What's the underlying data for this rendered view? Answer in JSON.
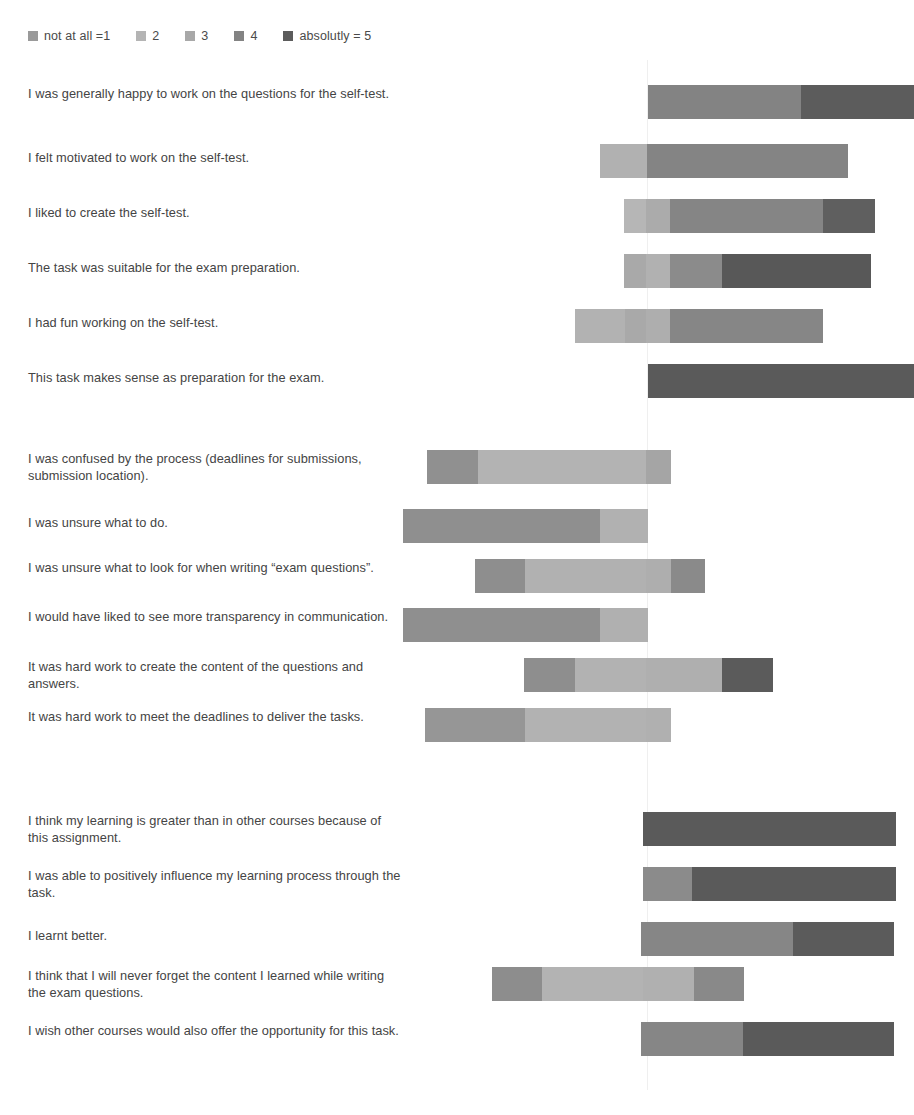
{
  "legend": {
    "title": "",
    "items": [
      {
        "label": "not at all =1",
        "value": 1,
        "color": "#9a9a9a"
      },
      {
        "label": "2",
        "value": 2,
        "color": "#b4b4b4"
      },
      {
        "label": "3",
        "value": 3,
        "color": "#a8a8a8"
      },
      {
        "label": "4",
        "value": 4,
        "color": "#838383"
      },
      {
        "label": "absolutly = 5",
        "value": 5,
        "color": "#5c5c5c"
      }
    ]
  },
  "chart_data": {
    "type": "bar",
    "subtype": "diverging-stacked-likert",
    "title": "",
    "xlabel": "",
    "ylabel": "",
    "scale": {
      "points": 5,
      "min_label": "not at all =1",
      "max_label": "absolutly = 5",
      "colors": [
        "#9a9a9a",
        "#b4b4b4",
        "#a8a8a8",
        "#838383",
        "#5c5c5c"
      ]
    },
    "axis": {
      "grid": false,
      "neutral_center_px": 647,
      "plot_left_px": 403,
      "plot_right_px": 914,
      "units": "percent of respondents"
    },
    "groups": [
      {
        "name": "group-1",
        "categories": [
          "I was generally happy to work on the questions for the self-test.",
          "I felt motivated to work on the self-test.",
          "I liked to create the self-test.",
          "The task was suitable for the exam preparation.",
          "I had fun working on the self-test.",
          "This task makes sense as preparation for the exam."
        ],
        "bars": [
          {
            "label": "I was generally happy to work on the questions for the self-test.",
            "start_px": 648,
            "end_px": 914,
            "segments": [
              {
                "value": 4,
                "color": "#838383",
                "start_px": 648,
                "end_px": 801,
                "width_px": 153
              },
              {
                "value": 5,
                "color": "#5c5c5c",
                "start_px": 801,
                "end_px": 914,
                "width_px": 113
              }
            ]
          },
          {
            "label": "I felt motivated to work on the self-test.",
            "start_px": 600,
            "end_px": 849,
            "segments": [
              {
                "value": 3,
                "color": "#b1b1b1",
                "start_px": 600,
                "end_px": 647,
                "width_px": 47
              },
              {
                "value": 4,
                "color": "#848484",
                "start_px": 648,
                "end_px": 849,
                "width_px": 201
              }
            ]
          },
          {
            "label": "I liked to create the self-test.",
            "start_px": 624,
            "end_px": 877,
            "segments": [
              {
                "value": 2,
                "color": "#b6b6b6",
                "start_px": 624,
                "end_px": 646,
                "width_px": 22
              },
              {
                "value": 3,
                "color": "#ababab",
                "start_px": 648,
                "end_px": 672,
                "width_px": 24
              },
              {
                "value": 4,
                "color": "#858585",
                "start_px": 672,
                "end_px": 825,
                "width_px": 153
              },
              {
                "value": 5,
                "color": "#5f5f5f",
                "start_px": 825,
                "end_px": 877,
                "width_px": 52
              }
            ]
          },
          {
            "label": "The task was suitable for the exam preparation.",
            "start_px": 624,
            "end_px": 873,
            "segments": [
              {
                "value": 2,
                "color": "#a9a9a9",
                "start_px": 624,
                "end_px": 646,
                "width_px": 22
              },
              {
                "value": 3,
                "color": "#b1b1b1",
                "start_px": 648,
                "end_px": 672,
                "width_px": 24
              },
              {
                "value": 4,
                "color": "#8b8b8b",
                "start_px": 672,
                "end_px": 724,
                "width_px": 52
              },
              {
                "value": 5,
                "color": "#585858",
                "start_px": 724,
                "end_px": 873,
                "width_px": 149
              }
            ]
          },
          {
            "label": "I had fun working on the self-test.",
            "start_px": 575,
            "end_px": 825,
            "segments": [
              {
                "value": 2,
                "color": "#b2b2b2",
                "start_px": 575,
                "end_px": 625,
                "width_px": 50
              },
              {
                "value": 3,
                "color": "#a9a9a9",
                "start_px": 625,
                "end_px": 646,
                "width_px": 21
              },
              {
                "value": 3,
                "color": "#aeaeae",
                "start_px": 648,
                "end_px": 672,
                "width_px": 24
              },
              {
                "value": 4,
                "color": "#868686",
                "start_px": 672,
                "end_px": 825,
                "width_px": 153
              }
            ]
          },
          {
            "label": "This task makes sense as preparation for the exam.",
            "start_px": 648,
            "end_px": 914,
            "segments": [
              {
                "value": 5,
                "color": "#5a5a5a",
                "start_px": 648,
                "end_px": 914,
                "width_px": 266
              }
            ]
          }
        ]
      },
      {
        "name": "group-2",
        "categories": [
          "I was confused by the process (deadlines for submissions, submission location).",
          "I was unsure what to do.",
          "I was unsure what to look for when writing \"exam questions\".",
          "I would have liked to see more transparency in communication.",
          "It was hard work to create the content of the questions and answers.",
          "It was hard work to meet the deadlines to deliver the tasks."
        ],
        "bars": [
          {
            "label": "I was confused by the process (deadlines for submissions, submission location).",
            "start_px": 427,
            "end_px": 673,
            "segments": [
              {
                "value": 1,
                "color": "#909090",
                "start_px": 427,
                "end_px": 478,
                "width_px": 51
              },
              {
                "value": 2,
                "color": "#b3b3b3",
                "start_px": 478,
                "end_px": 646,
                "width_px": 168
              },
              {
                "value": 3,
                "color": "#a5a5a5",
                "start_px": 648,
                "end_px": 673,
                "width_px": 25
              }
            ]
          },
          {
            "label": "I was unsure what to do.",
            "start_px": 403,
            "end_px": 648,
            "segments": [
              {
                "value": 1,
                "color": "#8f8f8f",
                "start_px": 403,
                "end_px": 600,
                "width_px": 197
              },
              {
                "value": 2,
                "color": "#b1b1b1",
                "start_px": 600,
                "end_px": 648,
                "width_px": 48
              }
            ]
          },
          {
            "label": "I was unsure what to look for when writing \"exam questions\".",
            "start_px": 475,
            "end_px": 707,
            "segments": [
              {
                "value": 1,
                "color": "#8e8e8e",
                "start_px": 475,
                "end_px": 525,
                "width_px": 50
              },
              {
                "value": 2,
                "color": "#b1b1b1",
                "start_px": 525,
                "end_px": 646,
                "width_px": 121
              },
              {
                "value": 3,
                "color": "#aeaeae",
                "start_px": 648,
                "end_px": 673,
                "width_px": 25
              },
              {
                "value": 4,
                "color": "#8a8a8a",
                "start_px": 673,
                "end_px": 707,
                "width_px": 34
              }
            ]
          },
          {
            "label": "I would have liked to see more transparency in communication.",
            "start_px": 403,
            "end_px": 648,
            "segments": [
              {
                "value": 1,
                "color": "#8f8f8f",
                "start_px": 403,
                "end_px": 600,
                "width_px": 197
              },
              {
                "value": 2,
                "color": "#b0b0b0",
                "start_px": 600,
                "end_px": 648,
                "width_px": 48
              }
            ]
          },
          {
            "label": "It was hard work to create the content of the questions and answers.",
            "start_px": 524,
            "end_px": 775,
            "segments": [
              {
                "value": 1,
                "color": "#8e8e8e",
                "start_px": 524,
                "end_px": 575,
                "width_px": 51
              },
              {
                "value": 2,
                "color": "#b2b2b2",
                "start_px": 575,
                "end_px": 646,
                "width_px": 71
              },
              {
                "value": 3,
                "color": "#afafaf",
                "start_px": 648,
                "end_px": 724,
                "width_px": 76
              },
              {
                "value": 5,
                "color": "#5b5b5b",
                "start_px": 724,
                "end_px": 775,
                "width_px": 51
              }
            ]
          },
          {
            "label": "It was hard work to meet the deadlines to deliver the tasks.",
            "start_px": 425,
            "end_px": 673,
            "segments": [
              {
                "value": 1,
                "color": "#969696",
                "start_px": 425,
                "end_px": 525,
                "width_px": 100
              },
              {
                "value": 2,
                "color": "#b2b2b2",
                "start_px": 525,
                "end_px": 646,
                "width_px": 121
              },
              {
                "value": 3,
                "color": "#b0b0b0",
                "start_px": 648,
                "end_px": 673,
                "width_px": 25
              }
            ]
          }
        ]
      },
      {
        "name": "group-3",
        "categories": [
          "I think my learning is greater than in other courses because of this assignment.",
          "I was able to positively influence my learning process through the task.",
          "I learnt better.",
          "I think that I will never forget the content I learned while writing the exam questions.",
          "I wish other courses would also offer the opportunity for this task."
        ],
        "bars": [
          {
            "label": "I think my learning is greater than in other courses because of this assignment.",
            "start_px": 643,
            "end_px": 896,
            "segments": [
              {
                "value": 5,
                "color": "#5a5a5a",
                "start_px": 643,
                "end_px": 896,
                "width_px": 253
              }
            ]
          },
          {
            "label": "I was able to positively influence my learning process through the task.",
            "start_px": 643,
            "end_px": 896,
            "segments": [
              {
                "value": 4,
                "color": "#8b8b8b",
                "start_px": 643,
                "end_px": 692,
                "width_px": 49
              },
              {
                "value": 5,
                "color": "#5a5a5a",
                "start_px": 692,
                "end_px": 896,
                "width_px": 204
              }
            ]
          },
          {
            "label": "I learnt better.",
            "start_px": 641,
            "end_px": 894,
            "segments": [
              {
                "value": 4,
                "color": "#868686",
                "start_px": 641,
                "end_px": 793,
                "width_px": 152
              },
              {
                "value": 5,
                "color": "#5b5b5b",
                "start_px": 793,
                "end_px": 894,
                "width_px": 101
              }
            ]
          },
          {
            "label": "I think that I will never forget the content I learned while writing the exam questions.",
            "start_px": 492,
            "end_px": 744,
            "segments": [
              {
                "value": 1,
                "color": "#8d8d8d",
                "start_px": 492,
                "end_px": 542,
                "width_px": 50
              },
              {
                "value": 2,
                "color": "#b3b3b3",
                "start_px": 542,
                "end_px": 643,
                "width_px": 101
              },
              {
                "value": 3,
                "color": "#b0b0b0",
                "start_px": 643,
                "end_px": 694,
                "width_px": 51
              },
              {
                "value": 4,
                "color": "#898989",
                "start_px": 694,
                "end_px": 744,
                "width_px": 50
              }
            ]
          },
          {
            "label": "I wish other courses would also offer the opportunity for this task.",
            "start_px": 641,
            "end_px": 894,
            "segments": [
              {
                "value": 4,
                "color": "#868686",
                "start_px": 641,
                "end_px": 743,
                "width_px": 102
              },
              {
                "value": 5,
                "color": "#5a5a5a",
                "start_px": 743,
                "end_px": 894,
                "width_px": 151
              }
            ]
          }
        ]
      }
    ]
  },
  "rows": [
    {
      "label": "I was generally happy to work on the questions for the self-test.",
      "label_top": 85,
      "bar_top": 85
    },
    {
      "label": "I felt motivated to work on the self-test.",
      "label_top": 149,
      "bar_top": 144
    },
    {
      "label": "I liked to create the self-test.",
      "label_top": 204,
      "bar_top": 199
    },
    {
      "label": "The task was suitable for the exam preparation.",
      "label_top": 259,
      "bar_top": 254
    },
    {
      "label": "I had fun working on the self-test.",
      "label_top": 314,
      "bar_top": 309
    },
    {
      "label": "This task makes sense as preparation for the exam.",
      "label_top": 369,
      "bar_top": 364
    },
    {
      "label": "I was confused by the process (deadlines for submissions, submission location).",
      "label_top": 450,
      "bar_top": 450
    },
    {
      "label": "I was unsure what to do.",
      "label_top": 514,
      "bar_top": 509
    },
    {
      "label": "I was unsure what to look for when writing “exam questions”.",
      "label_top": 559,
      "bar_top": 559
    },
    {
      "label": "I would have liked to see more transparency in communication.",
      "label_top": 608,
      "bar_top": 608
    },
    {
      "label": "It was hard work to create the content of the questions and answers.",
      "label_top": 658,
      "bar_top": 658
    },
    {
      "label": "It was hard work to meet the deadlines to deliver the tasks.",
      "label_top": 708,
      "bar_top": 708
    },
    {
      "label": "I think my learning is greater than in other courses because of this assignment.",
      "label_top": 812,
      "bar_top": 812
    },
    {
      "label": "I was able to positively influence my learning process through the task.",
      "label_top": 867,
      "bar_top": 867
    },
    {
      "label": "I learnt better.",
      "label_top": 927,
      "bar_top": 922
    },
    {
      "label": "I think that I will never forget the content I learned while writing the exam questions.",
      "label_top": 967,
      "bar_top": 967
    },
    {
      "label": "I wish other courses would also offer the opportunity for this task.",
      "label_top": 1022,
      "bar_top": 1022
    }
  ]
}
